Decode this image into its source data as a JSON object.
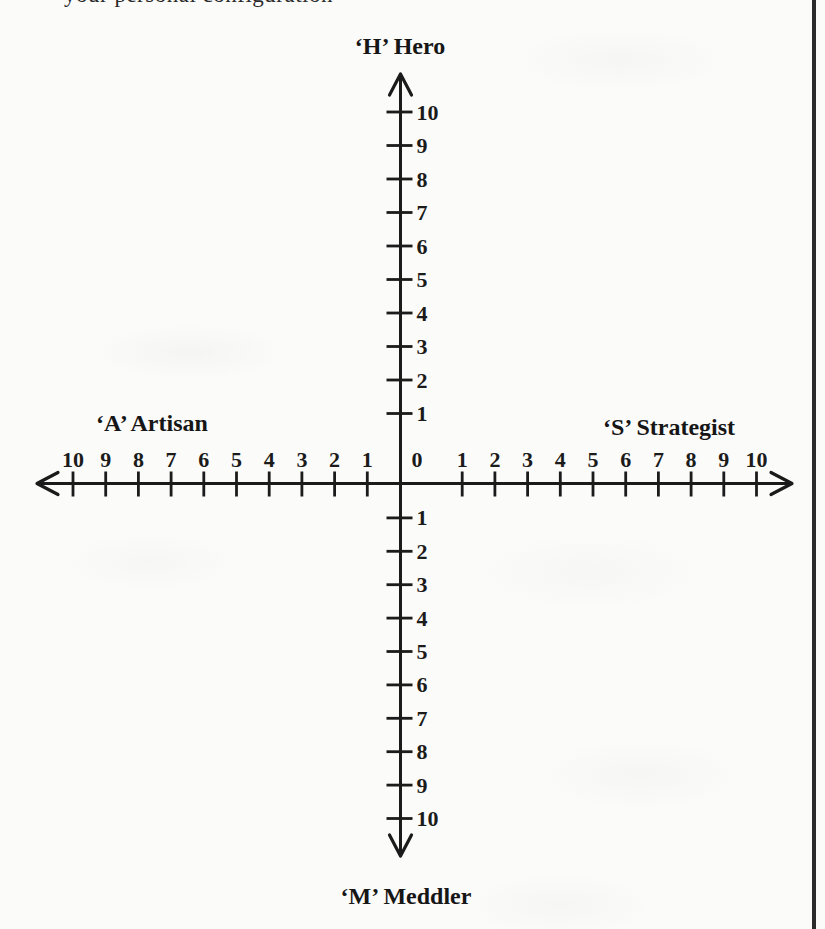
{
  "page": {
    "top_text_fragment": "your personal configuration",
    "colors": {
      "paper": "#fbfbfa",
      "ink": "#1b1b1b"
    }
  },
  "chart_data": {
    "type": "axes-diagram",
    "title": "",
    "quadrant_labels": {
      "up": "‘H’ Hero",
      "right": "‘S’ Strategist",
      "down": "‘M’ Meddler",
      "left": "‘A’ Artisan"
    },
    "origin_label": "0",
    "tick_labels": [
      "1",
      "2",
      "3",
      "4",
      "5",
      "6",
      "7",
      "8",
      "9",
      "10"
    ],
    "axis_range": [
      0,
      10
    ],
    "grid": false,
    "layout_hints": {
      "arms": "four arms from origin, each numbered 1-10 outward",
      "vertical_numbers_side": "right of axis",
      "horizontal_numbers_side": "above axis",
      "arrows": "open arrowheads at all four arm ends"
    }
  }
}
